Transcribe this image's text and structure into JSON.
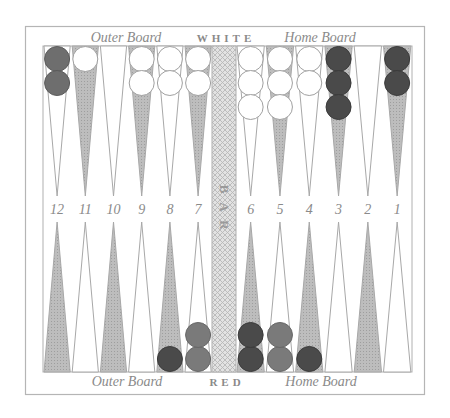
{
  "labels": {
    "top_left": "Outer Board",
    "top_center": "WHITE",
    "top_right": "Home Board",
    "bottom_left": "Outer Board",
    "bottom_center": "RED",
    "bottom_right": "Home Board",
    "bar": [
      "B",
      "A",
      "R"
    ]
  },
  "point_numbers": [
    "12",
    "11",
    "10",
    "9",
    "8",
    "7",
    "6",
    "5",
    "4",
    "3",
    "2",
    "1"
  ],
  "colors": {
    "frame": "#b5b5b5",
    "dark_point": "#b4b4b4",
    "light_point": "#ffffff",
    "point_stroke": "#a8a8a8",
    "bar_fill": "#d6d6d6",
    "checker_white": "#ffffff",
    "checker_white_stroke": "#a0a0a0",
    "checker_dark": "#4a4a4a",
    "checker_red": "#6e6e6e",
    "checker_mid": "#7a7a7a"
  },
  "top_points": [
    {
      "number": "12",
      "shade": "light",
      "checkers": {
        "color": "red",
        "count": 2
      }
    },
    {
      "number": "11",
      "shade": "dark",
      "checkers": {
        "color": "white",
        "count": 1
      }
    },
    {
      "number": "10",
      "shade": "light",
      "checkers": {
        "color": "none",
        "count": 0
      }
    },
    {
      "number": "9",
      "shade": "dark",
      "checkers": {
        "color": "white",
        "count": 2
      }
    },
    {
      "number": "8",
      "shade": "light",
      "checkers": {
        "color": "white",
        "count": 2
      }
    },
    {
      "number": "7",
      "shade": "dark",
      "checkers": {
        "color": "white",
        "count": 2
      }
    },
    {
      "number": "6",
      "shade": "light",
      "checkers": {
        "color": "white",
        "count": 3
      }
    },
    {
      "number": "5",
      "shade": "dark",
      "checkers": {
        "color": "white",
        "count": 3
      }
    },
    {
      "number": "4",
      "shade": "light",
      "checkers": {
        "color": "white",
        "count": 2
      }
    },
    {
      "number": "3",
      "shade": "dark",
      "checkers": {
        "color": "dark",
        "count": 3
      }
    },
    {
      "number": "2",
      "shade": "light",
      "checkers": {
        "color": "none",
        "count": 0
      }
    },
    {
      "number": "1",
      "shade": "dark",
      "checkers": {
        "color": "dark",
        "count": 2
      }
    }
  ],
  "bottom_points": [
    {
      "position": 13,
      "shade": "dark",
      "checkers": {
        "color": "none",
        "count": 0
      }
    },
    {
      "position": 14,
      "shade": "light",
      "checkers": {
        "color": "none",
        "count": 0
      }
    },
    {
      "position": 15,
      "shade": "dark",
      "checkers": {
        "color": "none",
        "count": 0
      }
    },
    {
      "position": 16,
      "shade": "light",
      "checkers": {
        "color": "none",
        "count": 0
      }
    },
    {
      "position": 17,
      "shade": "dark",
      "checkers": {
        "color": "dark",
        "count": 1
      }
    },
    {
      "position": 18,
      "shade": "light",
      "checkers": {
        "color": "mid",
        "count": 2
      }
    },
    {
      "position": 19,
      "shade": "dark",
      "checkers": {
        "color": "dark",
        "count": 2
      }
    },
    {
      "position": 20,
      "shade": "light",
      "checkers": {
        "color": "mid",
        "count": 2
      }
    },
    {
      "position": 21,
      "shade": "dark",
      "checkers": {
        "color": "dark",
        "count": 1
      }
    },
    {
      "position": 22,
      "shade": "light",
      "checkers": {
        "color": "none",
        "count": 0
      }
    },
    {
      "position": 23,
      "shade": "dark",
      "checkers": {
        "color": "none",
        "count": 0
      }
    },
    {
      "position": 24,
      "shade": "light",
      "checkers": {
        "color": "none",
        "count": 0
      }
    }
  ]
}
